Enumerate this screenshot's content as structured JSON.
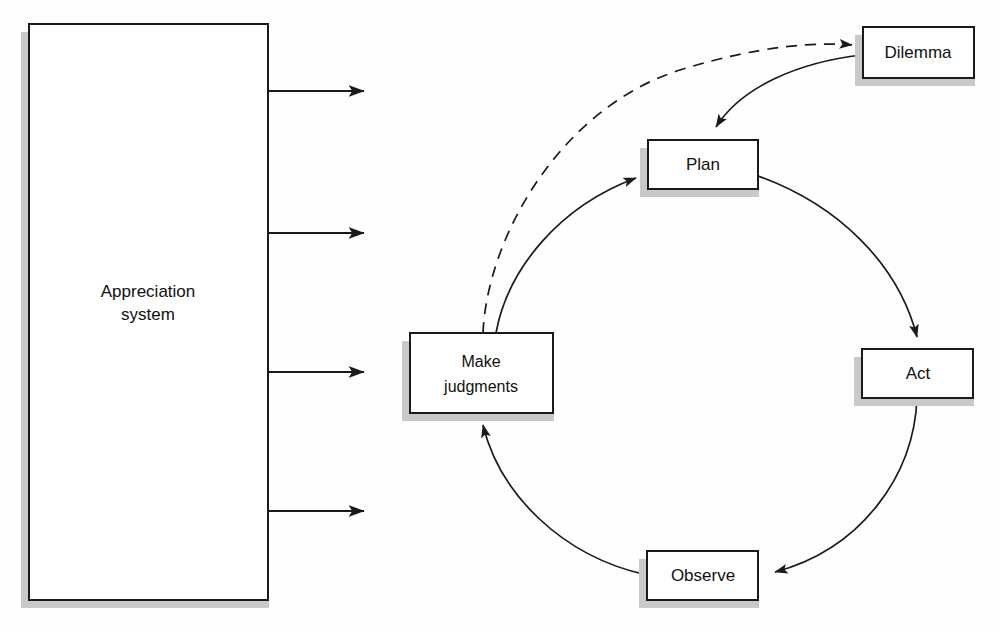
{
  "diagram": {
    "title_block": {
      "label_line1": "Appreciation",
      "label_line2": "system",
      "name": "appreciation-system"
    },
    "nodes": [
      {
        "id": "dilemma",
        "label": "Dilemma"
      },
      {
        "id": "plan",
        "label": "Plan"
      },
      {
        "id": "act",
        "label": "Act"
      },
      {
        "id": "observe",
        "label": "Observe"
      },
      {
        "id": "make-judgments",
        "label_line1": "Make",
        "label_line2": "judgments"
      }
    ],
    "connectors": [
      {
        "id": "judgments-to-dilemma",
        "style": "dashed",
        "from": "make-judgments",
        "to": "dilemma"
      },
      {
        "id": "dilemma-to-plan",
        "style": "solid",
        "from": "dilemma",
        "to": "plan"
      },
      {
        "id": "judgments-to-plan",
        "style": "solid",
        "from": "make-judgments",
        "to": "plan"
      },
      {
        "id": "plan-to-act",
        "style": "solid",
        "from": "plan",
        "to": "act"
      },
      {
        "id": "act-to-observe",
        "style": "solid",
        "from": "act",
        "to": "observe"
      },
      {
        "id": "observe-to-judgments",
        "style": "solid",
        "from": "observe",
        "to": "make-judgments"
      }
    ],
    "output_arrows": [
      {
        "id": "output-arrow-1"
      },
      {
        "id": "output-arrow-2"
      },
      {
        "id": "output-arrow-3"
      },
      {
        "id": "output-arrow-4"
      }
    ],
    "colors": {
      "stroke": "#1a1a1a",
      "box_fill": "#ffffff",
      "shadow": "#c9c9c9",
      "background": "#fefefe"
    }
  }
}
